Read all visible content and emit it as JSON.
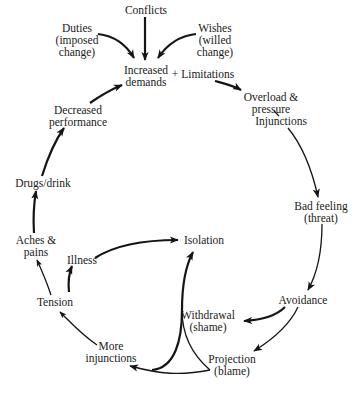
{
  "diagram": {
    "nodes": {
      "conflicts": {
        "lines": [
          "Conflicts"
        ]
      },
      "duties": {
        "lines": [
          "Duties",
          "(imposed",
          "change)"
        ]
      },
      "wishes": {
        "lines": [
          "Wishes",
          "(willed",
          "change)"
        ]
      },
      "increased_demands": {
        "lines": [
          "Increased",
          "demands"
        ]
      },
      "limitations": {
        "lines": [
          "+ Limitations"
        ]
      },
      "overload": {
        "lines": [
          "Overload &",
          "pressure"
        ]
      },
      "injunctions": {
        "lines": [
          "Injunctions"
        ]
      },
      "bad_feeling": {
        "lines": [
          "Bad feeling",
          "(threat)"
        ]
      },
      "avoidance": {
        "lines": [
          "Avoidance"
        ]
      },
      "withdrawal": {
        "lines": [
          "Withdrawal",
          "(shame)"
        ]
      },
      "projection": {
        "lines": [
          "Projection",
          "(blame)"
        ]
      },
      "more_injunctions": {
        "lines": [
          "More",
          "injunctions"
        ]
      },
      "tension": {
        "lines": [
          "Tension"
        ]
      },
      "illness": {
        "lines": [
          "Illness"
        ]
      },
      "isolation": {
        "lines": [
          "Isolation"
        ]
      },
      "aches_pains": {
        "lines": [
          "Aches &",
          "pains"
        ]
      },
      "drugs_drink": {
        "lines": [
          "Drugs/drink"
        ]
      },
      "decreased_performance": {
        "lines": [
          "Decreased",
          "performance"
        ]
      }
    },
    "edges": [
      {
        "from": "conflicts",
        "to": "increased_demands"
      },
      {
        "from": "duties",
        "to": "increased_demands"
      },
      {
        "from": "wishes",
        "to": "increased_demands"
      },
      {
        "from": "limitations",
        "to": "overload"
      },
      {
        "from": "pressure",
        "to": "injunctions"
      },
      {
        "from": "injunctions",
        "to": "bad_feeling"
      },
      {
        "from": "bad_feeling",
        "to": "avoidance"
      },
      {
        "from": "avoidance",
        "to": "withdrawal"
      },
      {
        "from": "avoidance",
        "to": "projection"
      },
      {
        "from": "withdrawal",
        "to": "isolation"
      },
      {
        "from": "withdrawal",
        "to": "more_injunctions"
      },
      {
        "from": "projection",
        "to": "more_injunctions"
      },
      {
        "from": "more_injunctions",
        "to": "tension"
      },
      {
        "from": "tension",
        "to": "illness"
      },
      {
        "from": "tension",
        "to": "aches_pains"
      },
      {
        "from": "illness",
        "to": "isolation"
      },
      {
        "from": "aches_pains",
        "to": "drugs_drink"
      },
      {
        "from": "drugs_drink",
        "to": "decreased_performance"
      },
      {
        "from": "decreased_performance",
        "to": "increased_demands"
      }
    ]
  }
}
